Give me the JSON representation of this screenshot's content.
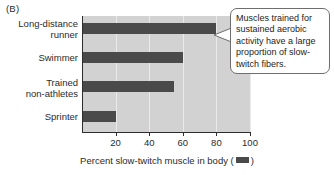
{
  "panel": {
    "label": "(B)"
  },
  "chart_data": {
    "type": "bar",
    "orientation": "horizontal",
    "title": "",
    "xlabel": "Percent slow-twitch muscle in body",
    "ylabel": "",
    "categories": [
      "Long-distance\nrunner",
      "Swimmer",
      "Trained\nnon-athletes",
      "Sprinter"
    ],
    "values": [
      80,
      60,
      55,
      20
    ],
    "xlim": [
      0,
      100
    ],
    "xticks": [
      20,
      40,
      60,
      80,
      100
    ],
    "xtick_labels": [
      "20",
      "40",
      "60",
      "80",
      "100"
    ],
    "grid": true,
    "legend": "none",
    "bar_color": "#4a4a4a",
    "plot_background": "#d2d2d2",
    "annotations": [
      {
        "text": "Muscles trained for sustained aerobic activity have a large proportion of slow-twitch fibers.",
        "points_to_category": "Long-distance runner"
      }
    ]
  },
  "axis": {
    "title_prefix": "Percent slow-twitch muscle in body (",
    "title_suffix": ")"
  },
  "callout": {
    "text": "Muscles trained for sustained aerobic activity have a large proportion of slow-twitch fibers."
  }
}
